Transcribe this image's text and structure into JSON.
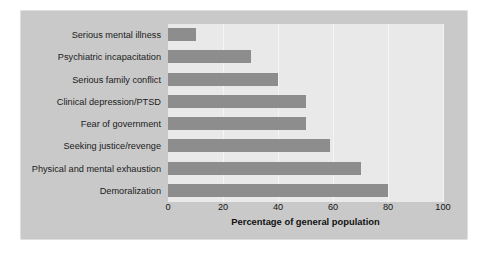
{
  "chart_data": {
    "type": "bar",
    "orientation": "horizontal",
    "title": "",
    "xlabel": "Percentage of general population",
    "ylabel": "",
    "xlim": [
      0,
      100
    ],
    "xticks": [
      0,
      20,
      40,
      60,
      80,
      100
    ],
    "xtick_labels": [
      "0",
      "20",
      "40",
      "60",
      "80",
      "100"
    ],
    "grid": true,
    "legend": false,
    "categories": [
      "Serious mental illness",
      "Psychiatric incapacitation",
      "Serious family conflict",
      "Clinical depression/PTSD",
      "Fear of government",
      "Seeking justice/revenge",
      "Physical and mental exhaustion",
      "Demoralization"
    ],
    "values": [
      10,
      30,
      40,
      50,
      50,
      59,
      70,
      80
    ],
    "bar_color": "#8d8d8d",
    "plot_background": "#e9e9e9",
    "panel_background": "#c9c9c9",
    "page_background": "#ffffff"
  }
}
